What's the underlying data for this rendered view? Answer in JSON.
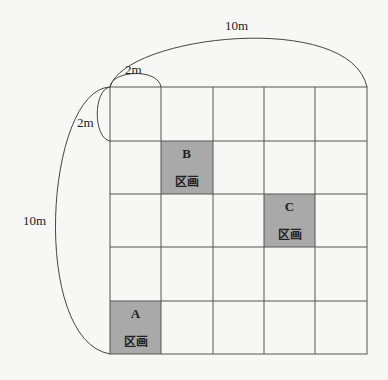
{
  "diagram": {
    "title": "",
    "dimensions": {
      "top_total": "10m",
      "left_total": "10m",
      "cell_width": "2m",
      "cell_height": "2m"
    },
    "grid": {
      "rows": 5,
      "cols": 5,
      "origin_x": 110,
      "origin_y": 87,
      "cell_w": 51.4,
      "cell_h": 53.4,
      "line_color": "#555555",
      "shade_color": "#a9a9a9"
    },
    "plots": [
      {
        "letter": "A",
        "word": "区画",
        "row": 4,
        "col": 0
      },
      {
        "letter": "B",
        "word": "区画",
        "row": 1,
        "col": 1
      },
      {
        "letter": "C",
        "word": "区画",
        "row": 2,
        "col": 3
      }
    ]
  }
}
